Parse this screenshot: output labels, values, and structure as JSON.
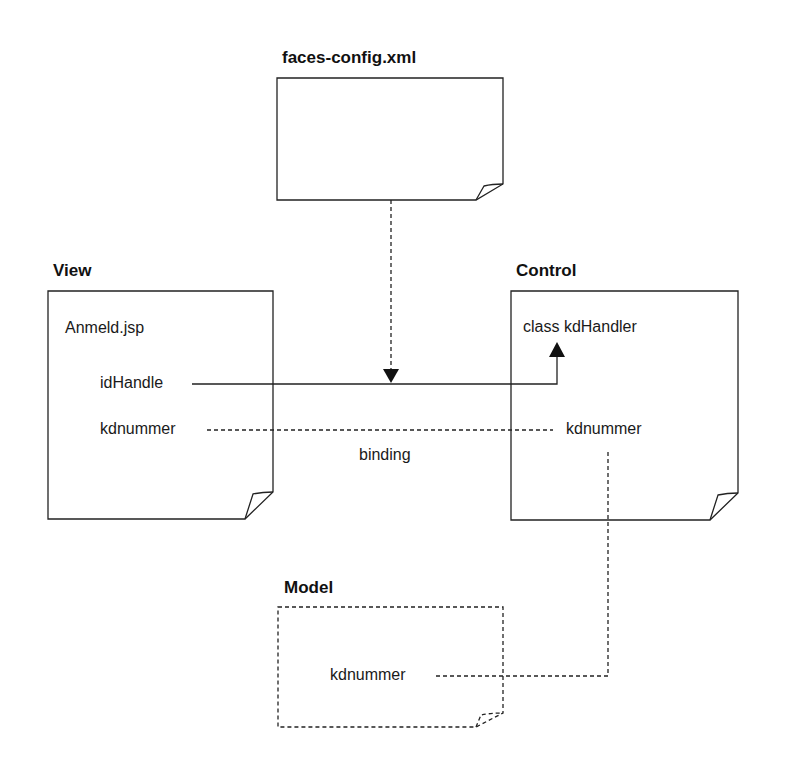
{
  "diagram": {
    "nodes": {
      "faces_config": {
        "title": "faces-config.xml",
        "style": "solid",
        "box": {
          "x": 277,
          "y": 78,
          "w": 226,
          "h": 122
        }
      },
      "view": {
        "title": "View",
        "style": "solid",
        "box": {
          "x": 48,
          "y": 291,
          "w": 225,
          "h": 228
        },
        "file": "Anmeld.jsp",
        "fields": [
          "idHandle",
          "kdnummer"
        ]
      },
      "control": {
        "title": "Control",
        "style": "solid",
        "box": {
          "x": 511,
          "y": 291,
          "w": 227,
          "h": 229
        },
        "class_label": "class kdHandler",
        "fields": [
          "kdnummer"
        ]
      },
      "model": {
        "title": "Model",
        "style": "dashed",
        "box": {
          "x": 278,
          "y": 607,
          "w": 225,
          "h": 120
        },
        "fields": [
          "kdnummer"
        ]
      }
    },
    "edges": [
      {
        "from": "faces_config",
        "to": "idHandle-link",
        "style": "dashed",
        "arrow": "down"
      },
      {
        "from": "view.idHandle",
        "to": "control.class kdHandler",
        "style": "solid",
        "arrow": "up"
      },
      {
        "from": "view.kdnummer",
        "to": "control.kdnummer",
        "style": "dashed",
        "label": "binding"
      },
      {
        "from": "control.kdnummer",
        "to": "model.kdnummer",
        "style": "dashed"
      }
    ],
    "binding_label": "binding",
    "colors": {
      "line": "#222222",
      "background": "#ffffff"
    }
  }
}
